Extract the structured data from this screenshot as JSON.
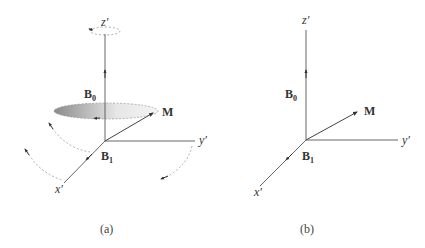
{
  "panels": [
    {
      "id": "a",
      "caption": "(a)",
      "axes": {
        "z": "z′",
        "y": "y′",
        "x": "x′"
      },
      "vectors": {
        "B0": "B",
        "B0_sub": "0",
        "M": "M",
        "B1": "B",
        "B1_sub": "1"
      },
      "features": [
        "precession-disc",
        "dashed-rotation-arcs",
        "z-rotation-ellipse"
      ]
    },
    {
      "id": "b",
      "caption": "(b)",
      "axes": {
        "z": "z′",
        "y": "y′",
        "x": "x′"
      },
      "vectors": {
        "B0": "B",
        "B0_sub": "0",
        "M": "M",
        "B1": "B",
        "B1_sub": "1"
      }
    }
  ],
  "colors": {
    "axis": "#555555",
    "dashed": "#999999",
    "disc_dark": "#8a8a8a",
    "disc_light": "#f2f2f2"
  }
}
